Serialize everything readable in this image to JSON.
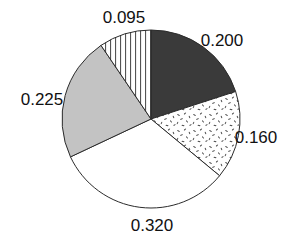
{
  "chart_data": {
    "type": "pie",
    "title": "",
    "subtitle": "",
    "xlabel": "",
    "ylabel": "",
    "legend_position": "none",
    "grid": false,
    "labels_are_values": true,
    "label_format": "0.000",
    "start_angle_deg": 0,
    "direction": "clockwise",
    "categories": [
      "0.200",
      "0.160",
      "0.320",
      "0.225",
      "0.095"
    ],
    "values": [
      0.2,
      0.16,
      0.32,
      0.225,
      0.095
    ],
    "total": 1.0,
    "slices": [
      {
        "label": "0.200",
        "value": 0.2,
        "fraction": 0.2,
        "angle_deg": 72.0,
        "start_deg": 0.0,
        "end_deg": 72.0,
        "fill_style": "solid-dark",
        "fill_color": "#3a3a3a",
        "edge_color": "#2b2b2b",
        "label_x": 222,
        "label_y": 42
      },
      {
        "label": "0.160",
        "value": 0.16,
        "fraction": 0.16,
        "angle_deg": 57.6,
        "start_deg": 72.0,
        "end_deg": 129.6,
        "fill_style": "speckle-dots",
        "fill_color": "#ffffff",
        "edge_color": "#2b2b2b",
        "label_x": 256,
        "label_y": 139
      },
      {
        "label": "0.320",
        "value": 0.32,
        "fraction": 0.32,
        "angle_deg": 115.2,
        "start_deg": 129.6,
        "end_deg": 244.8,
        "fill_style": "solid-white",
        "fill_color": "#ffffff",
        "edge_color": "#2b2b2b",
        "label_x": 152,
        "label_y": 227
      },
      {
        "label": "0.225",
        "value": 0.225,
        "fraction": 0.225,
        "angle_deg": 81.0,
        "start_deg": 244.8,
        "end_deg": 325.8,
        "fill_style": "solid-lightgray",
        "fill_color": "#c3c3c3",
        "edge_color": "#2b2b2b",
        "label_x": 42,
        "label_y": 101
      },
      {
        "label": "0.095",
        "value": 0.095,
        "fraction": 0.095,
        "angle_deg": 34.2,
        "start_deg": 325.8,
        "end_deg": 360.0,
        "fill_style": "vertical-lines",
        "fill_color": "#ffffff",
        "edge_color": "#2b2b2b",
        "label_x": 124,
        "label_y": 19
      }
    ],
    "geometry": {
      "center_x": 151,
      "center_y": 119,
      "radius": 89
    }
  },
  "labels": {
    "slice_1": "0.200",
    "slice_2": "0.160",
    "slice_3": "0.320",
    "slice_4": "0.225",
    "slice_5": "0.095"
  }
}
